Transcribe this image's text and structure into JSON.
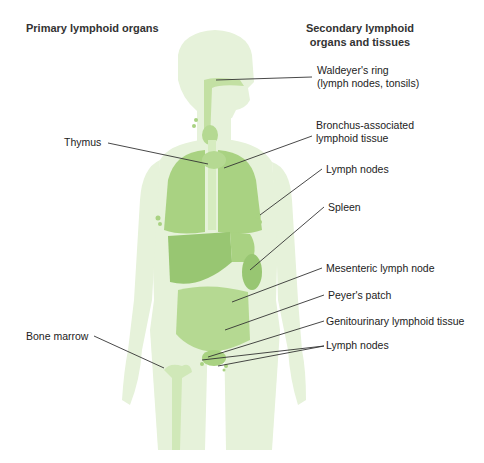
{
  "headings": {
    "primary": "Primary lymphoid organs",
    "secondary_line1": "Secondary lymphoid",
    "secondary_line2": "organs and tissues"
  },
  "labels": {
    "waldeyer_line1": "Waldeyer's ring",
    "waldeyer_line2": "(lymph nodes, tonsils)",
    "thymus": "Thymus",
    "balt_line1": "Bronchus-associated",
    "balt_line2": "lymphoid tissue",
    "lymph_nodes_axillary": "Lymph nodes",
    "spleen": "Spleen",
    "mesenteric": "Mesenteric lymph node",
    "peyers": "Peyer's patch",
    "genitourinary": "Genitourinary lymphoid tissue",
    "bone_marrow": "Bone marrow",
    "lymph_nodes_inguinal": "Lymph nodes"
  },
  "colors": {
    "body": "#e6f2da",
    "organ_light": "#c3e0a3",
    "organ": "#a9d282",
    "organ_dark": "#98c672",
    "leader_line": "#333333"
  }
}
